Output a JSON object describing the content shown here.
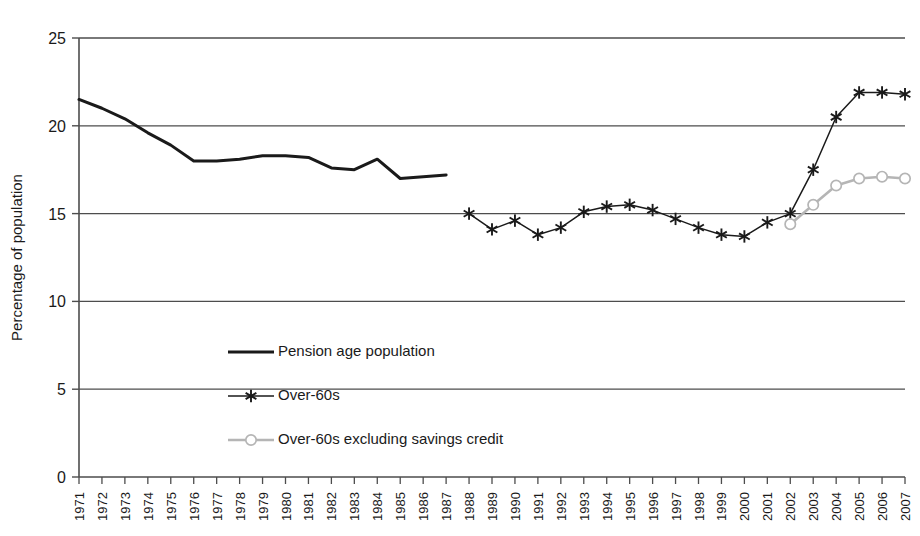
{
  "chart_data": {
    "type": "line",
    "title": "",
    "xlabel": "",
    "ylabel": "Percentage of population",
    "ylim": [
      0,
      25
    ],
    "yticks": [
      0,
      5,
      10,
      15,
      20,
      25
    ],
    "ytick_labels": [
      "0",
      "5",
      "10",
      "15",
      "20",
      "25"
    ],
    "grid": true,
    "grid_axis": "y",
    "legend_position": "inside-lower-left",
    "x": [
      "1971",
      "1972",
      "1973",
      "1974",
      "1975",
      "1976",
      "1977",
      "1978",
      "1979",
      "1980",
      "1981",
      "1982",
      "1983",
      "1984",
      "1985",
      "1986",
      "1987",
      "1988",
      "1989",
      "1990",
      "1991",
      "1992",
      "1993",
      "1994",
      "1995",
      "1996",
      "1997",
      "1998",
      "1999",
      "2000",
      "2001",
      "2002",
      "2003",
      "2004",
      "2005",
      "2006",
      "2007"
    ],
    "series": [
      {
        "name": "Pension age population",
        "marker": "none",
        "color": "#1a1a1a",
        "style": "solid-thick",
        "values": [
          21.5,
          21.0,
          20.4,
          19.6,
          18.9,
          18.0,
          18.0,
          18.1,
          18.3,
          18.3,
          18.2,
          17.6,
          17.5,
          18.1,
          17.0,
          17.1,
          17.2,
          null,
          null,
          null,
          null,
          null,
          null,
          null,
          null,
          null,
          null,
          null,
          null,
          null,
          null,
          null,
          null,
          null,
          null,
          null,
          null
        ]
      },
      {
        "name": "Over-60s",
        "marker": "asterisk",
        "color": "#1a1a1a",
        "style": "solid-thin",
        "values": [
          null,
          null,
          null,
          null,
          null,
          null,
          null,
          null,
          null,
          null,
          null,
          null,
          null,
          null,
          null,
          null,
          null,
          15.0,
          14.1,
          14.6,
          13.8,
          14.2,
          15.1,
          15.4,
          15.5,
          15.2,
          14.7,
          14.2,
          13.8,
          13.7,
          14.5,
          15.0,
          17.5,
          20.5,
          21.9,
          21.9,
          21.8
        ]
      },
      {
        "name": "Over-60s excluding savings credit",
        "marker": "circle",
        "color": "#b5b5b5",
        "style": "solid-grey",
        "values": [
          null,
          null,
          null,
          null,
          null,
          null,
          null,
          null,
          null,
          null,
          null,
          null,
          null,
          null,
          null,
          null,
          null,
          null,
          null,
          null,
          null,
          null,
          null,
          null,
          null,
          null,
          null,
          null,
          null,
          null,
          null,
          14.4,
          15.5,
          16.6,
          17.0,
          17.1,
          17.0
        ]
      }
    ]
  },
  "legend": {
    "items": [
      {
        "label": "Pension age population",
        "marker": "line",
        "color": "#1a1a1a"
      },
      {
        "label": "Over-60s",
        "marker": "asterisk",
        "color": "#1a1a1a"
      },
      {
        "label": "Over-60s excluding savings credit",
        "marker": "circle",
        "color": "#b5b5b5"
      }
    ]
  },
  "axis": {
    "y_title": "Percentage of population"
  },
  "colors": {
    "ink": "#1a1a1a",
    "grid": "#4d4d4d",
    "grey_series": "#b5b5b5",
    "background": "#ffffff"
  }
}
